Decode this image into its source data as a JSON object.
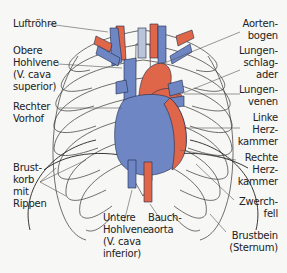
{
  "diagram": {
    "colors": {
      "artery": "#e0664a",
      "vein": "#6e86c4",
      "outline": "#1e2a4a",
      "rib_line": "#333333",
      "background": "#f7f7f5"
    },
    "labels_left": [
      {
        "lines": [
          "Luftröhre"
        ]
      },
      {
        "lines": [
          "Obere",
          "Hohlvene",
          "(V. cava",
          "superior)"
        ]
      },
      {
        "lines": [
          "Rechter",
          "Vorhof"
        ]
      },
      {
        "lines": [
          "Brust-",
          "korb",
          "mit",
          "Rippen"
        ]
      }
    ],
    "labels_right": [
      {
        "lines": [
          "Aorten-",
          "bogen"
        ]
      },
      {
        "lines": [
          "Lungen-",
          "schlag-",
          "ader"
        ]
      },
      {
        "lines": [
          "Lungen-",
          "venen"
        ]
      },
      {
        "lines": [
          "Linke",
          "Herz-",
          "kammer"
        ]
      },
      {
        "lines": [
          "Rechte",
          "Herz-",
          "kammer"
        ]
      },
      {
        "lines": [
          "Zwerch-",
          "fell"
        ]
      },
      {
        "lines": [
          "Brustbein",
          "(Sternum)"
        ]
      }
    ],
    "labels_bottom": [
      {
        "lines": [
          "Untere",
          "Hohlvene",
          "(V. cava",
          "inferior)"
        ]
      },
      {
        "lines": [
          "Bauch-",
          "aorta"
        ]
      }
    ]
  }
}
